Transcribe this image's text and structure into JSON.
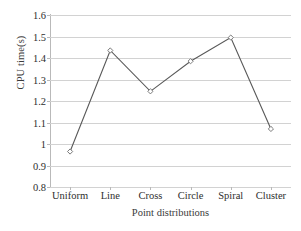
{
  "chart_data": {
    "type": "line",
    "title": "",
    "xlabel": "Point distributions",
    "ylabel": "CPU time(s)",
    "categories": [
      "Uniform",
      "Line",
      "Cross",
      "Circle",
      "Spiral",
      "Cluster"
    ],
    "values": [
      0.965,
      1.435,
      1.245,
      1.385,
      1.495,
      1.07
    ],
    "series": [
      {
        "name": "CPU time",
        "values": [
          0.965,
          1.435,
          1.245,
          1.385,
          1.495,
          1.07
        ]
      }
    ],
    "ylim": [
      0.8,
      1.6
    ],
    "y_ticks": [
      1.6,
      1.5,
      1.4,
      1.3,
      1.2,
      1.1,
      1,
      0.9,
      0.8
    ],
    "y_tick_labels": [
      "1.6",
      "1.5",
      "1.4",
      "1.3",
      "1.2",
      "1.1",
      "1",
      "0.9",
      "0.8"
    ],
    "grid": true,
    "legend": "none",
    "marker": "diamond-open",
    "line_color": "#595959",
    "marker_color": "#7a7a7a",
    "grid_color": "#d2d2d2"
  },
  "axes": {
    "y_title": "CPU time(s)",
    "x_title": "Point distributions"
  }
}
